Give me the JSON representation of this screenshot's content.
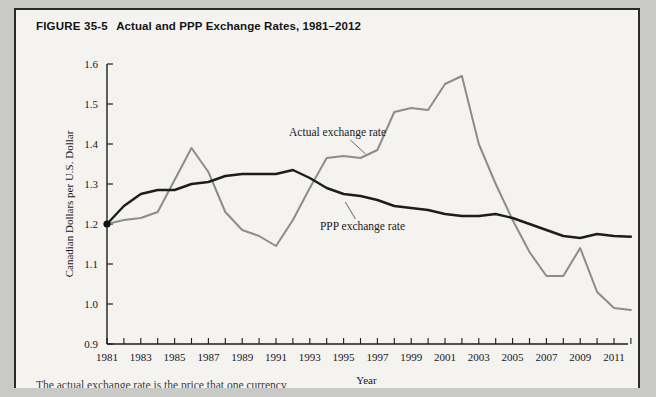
{
  "figure": {
    "label": "FIGURE 35-5",
    "title": "Actual and PPP Exchange Rates, 1981–2012",
    "caption_partial": "The actual exchange rate is the price that one currency"
  },
  "chart_data": {
    "type": "line",
    "title": "Actual and PPP Exchange Rates, 1981–2012",
    "xlabel": "Year",
    "ylabel": "Canadian Dollars per U.S. Dollar",
    "xlim": [
      1981,
      2012
    ],
    "ylim": [
      0.9,
      1.6
    ],
    "yticks": [
      "0.9",
      "1.0",
      "1.1",
      "1.2",
      "1.3",
      "1.4",
      "1.5",
      "1.6"
    ],
    "ytick_values": [
      0.9,
      1.0,
      1.1,
      1.2,
      1.3,
      1.4,
      1.5,
      1.6
    ],
    "xticks": [
      "1981",
      "1983",
      "1985",
      "1987",
      "1989",
      "1991",
      "1993",
      "1995",
      "1997",
      "1999",
      "2001",
      "2003",
      "2005",
      "2007",
      "2009",
      "2011"
    ],
    "xtick_values": [
      1981,
      1983,
      1985,
      1987,
      1989,
      1991,
      1993,
      1995,
      1997,
      1999,
      2001,
      2003,
      2005,
      2007,
      2009,
      2011
    ],
    "grid": false,
    "legend_position": "inline-annotations",
    "x": [
      1981,
      1982,
      1983,
      1984,
      1985,
      1986,
      1987,
      1988,
      1989,
      1990,
      1991,
      1992,
      1993,
      1994,
      1995,
      1996,
      1997,
      1998,
      1999,
      2000,
      2001,
      2002,
      2003,
      2004,
      2005,
      2006,
      2007,
      2008,
      2009,
      2010,
      2011,
      2012
    ],
    "series": [
      {
        "name": "Actual exchange rate",
        "color": "#8c8c8c",
        "values": [
          1.2,
          1.21,
          1.215,
          1.23,
          1.31,
          1.39,
          1.33,
          1.23,
          1.185,
          1.17,
          1.145,
          1.21,
          1.29,
          1.365,
          1.37,
          1.365,
          1.385,
          1.48,
          1.49,
          1.485,
          1.55,
          1.57,
          1.4,
          1.3,
          1.21,
          1.13,
          1.07,
          1.07,
          1.14,
          1.03,
          0.99,
          0.985
        ]
      },
      {
        "name": "PPP exchange rate",
        "color": "#1d1d1d",
        "values": [
          1.2,
          1.245,
          1.275,
          1.285,
          1.285,
          1.3,
          1.305,
          1.32,
          1.325,
          1.325,
          1.325,
          1.335,
          1.315,
          1.29,
          1.275,
          1.27,
          1.26,
          1.245,
          1.24,
          1.235,
          1.225,
          1.22,
          1.22,
          1.225,
          1.215,
          1.2,
          1.185,
          1.17,
          1.165,
          1.175,
          1.17,
          1.168
        ]
      }
    ],
    "annotations": [
      {
        "text": "Actual exchange rate",
        "x": 1995,
        "y": 1.42
      },
      {
        "text": "PPP exchange rate",
        "x": 1996,
        "y": 1.185
      }
    ],
    "markers": [
      {
        "name": "start-point",
        "x": 1981,
        "y": 1.2
      }
    ]
  }
}
